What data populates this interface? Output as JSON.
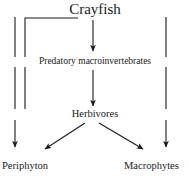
{
  "diagram": {
    "type": "food-web-flow-diagram",
    "background_color": "#ffffff",
    "line_color": "#1a1a1a",
    "nodes": [
      {
        "id": "crayfish",
        "label": "Crayfish"
      },
      {
        "id": "predatory_macroinvertebrates",
        "label": "Predatory macroinvertebrates"
      },
      {
        "id": "herbivores",
        "label": "Herbivores"
      },
      {
        "id": "periphyton",
        "label": "Periphyton"
      },
      {
        "id": "macrophytes",
        "label": "Macrophytes"
      }
    ],
    "edges": [
      {
        "from": "crayfish",
        "to": "predatory_macroinvertebrates",
        "style": "straight-down"
      },
      {
        "from": "predatory_macroinvertebrates",
        "to": "herbivores",
        "style": "straight-down"
      },
      {
        "from": "crayfish",
        "to": "herbivores",
        "style": "elbow-left-inner"
      },
      {
        "from": "crayfish",
        "to": "periphyton",
        "style": "elbow-left-outer"
      },
      {
        "from": "crayfish",
        "to": "macrophytes",
        "style": "elbow-right"
      },
      {
        "from": "herbivores",
        "to": "periphyton",
        "style": "diagonal-down-left"
      },
      {
        "from": "herbivores",
        "to": "macrophytes",
        "style": "diagonal-down-right"
      }
    ]
  }
}
